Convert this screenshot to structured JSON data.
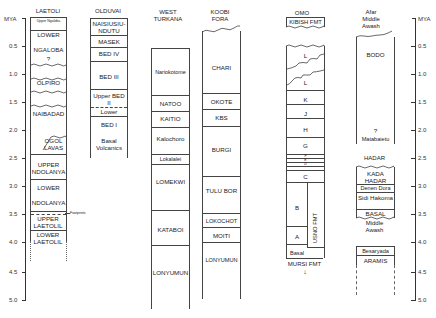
{
  "axis": {
    "unit": "MYA",
    "ticks": [
      "0.5",
      "1.0",
      "1.5",
      "2.0",
      "2.5",
      "3.0",
      "3.5",
      "4.0",
      "4.5",
      "5.0"
    ]
  },
  "columns": {
    "laetoli": {
      "title": "LAETOLI",
      "units": [
        "Upper Ngaloba",
        "LOWER",
        "NGALOBA",
        "?",
        "OLPIRO",
        "NAIBADAD",
        "OGOL LAVAS",
        "UPPER NDOLANYA",
        "LOWER",
        "NDOLANYA",
        "UPPER LAETOLIL",
        "LOWER LAETOLIL"
      ],
      "annotation": "Footprints"
    },
    "olduvai": {
      "title": "OLDUVAI",
      "units": [
        "NAISIUSIU-NDUTU",
        "MASEK",
        "BED IV",
        "BED III",
        "Upper BED II",
        "Lower",
        "BED I",
        "Basal Volcanics"
      ]
    },
    "west_turkana": {
      "title_line1": "WEST",
      "title_line2": "TURKANA",
      "units": [
        "Nariokotome",
        "NATOO",
        "KAITIO",
        "Kalochoro",
        "Lokalalei",
        "LOMEKWI",
        "KATABOI",
        "LONYUMUN"
      ]
    },
    "koobi_fora": {
      "title_line1": "KOOBI",
      "title_line2": "FORA",
      "units": [
        "CHARI",
        "OKOTE",
        "KBS",
        "BURGI",
        "TULU BOR",
        "LOKOCHOT",
        "MOITI",
        "LONYUMUN"
      ]
    },
    "omo": {
      "title": "OMO",
      "top_formation": "KIBISH FMT",
      "units": [
        "L",
        "L",
        "K",
        "J",
        "H",
        "G",
        "F",
        "E",
        "D",
        "C",
        "B",
        "A",
        "Basal"
      ],
      "side_formation": "USNO FMT",
      "bottom_formation": "MURSI FMT",
      "arrow": "↓"
    },
    "afar": {
      "title_line1": "Afar",
      "title_line2": "Middle",
      "title_line3": "Awash",
      "units": [
        "BODO",
        "?",
        "Matabaietu"
      ],
      "hadar_title": "HADAR",
      "hadar_units": [
        "KADA HADAR",
        "Denen Dora",
        "Sidi Hakoma",
        "BASAL"
      ],
      "middle_awash_title_line1": "Middle",
      "middle_awash_title_line2": "Awash",
      "middle_awash_units": [
        "Besaryada",
        "ARAMIS"
      ]
    }
  }
}
